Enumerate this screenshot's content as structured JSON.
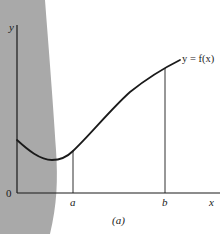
{
  "figure": {
    "caption": "(a)",
    "function_label": "y = f(x)",
    "axes": {
      "x_label": "x",
      "y_label": "y",
      "origin_label": "0"
    },
    "markers": [
      {
        "label": "a"
      },
      {
        "label": "b"
      }
    ],
    "colors": {
      "shade": "#a9a9a9",
      "ink": "#1a1a1a",
      "background": "#ffffff"
    }
  }
}
